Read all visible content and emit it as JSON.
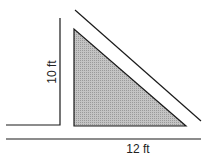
{
  "diagram": {
    "type": "geometry-figure",
    "shape": "right-triangle",
    "labels": {
      "height": "10 ft",
      "base": "12 ft"
    },
    "colors": {
      "fill": "#b5b5b5",
      "stroke": "#1a1a1a",
      "background": "#ffffff"
    }
  }
}
